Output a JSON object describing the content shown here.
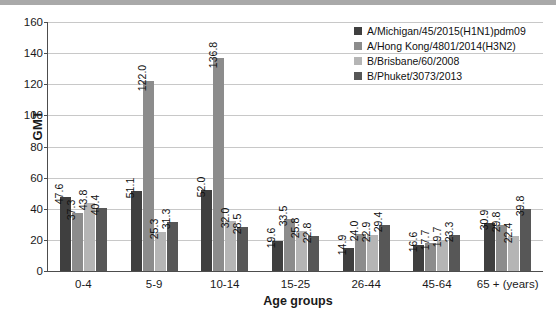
{
  "chart_data": {
    "type": "bar",
    "title": "",
    "xlabel": "Age groups",
    "ylabel": "GMT",
    "ylim": [
      0,
      160
    ],
    "yticks": [
      0,
      20,
      40,
      60,
      80,
      100,
      120,
      140,
      160
    ],
    "grid": true,
    "legend_position": "top-right",
    "categories": [
      "0-4",
      "5-9",
      "10-14",
      "15-25",
      "26-44",
      "45-64",
      "65 + (years)"
    ],
    "series": [
      {
        "name": "A/Michigan/45/2015(H1N1)pdm09",
        "color": "#3f3f3f",
        "values": [
          47.6,
          51.1,
          52.0,
          19.6,
          14.9,
          16.6,
          30.9
        ],
        "labels": [
          "47.6",
          "51.1",
          "52.0",
          "19.6",
          "14.9",
          "16.6",
          "30.9"
        ]
      },
      {
        "name": "A/Hong Kong/4801/2014(H3N2)",
        "color": "#8c8c8c",
        "values": [
          37.3,
          122.0,
          136.8,
          33.5,
          24.0,
          17.7,
          29.8
        ],
        "labels": [
          "37.3",
          "122.0",
          "136.8",
          "33.5",
          "24.0",
          "17.7",
          "29.8"
        ]
      },
      {
        "name": "B/Brisbane/60/2008",
        "color": "#b5b5b5",
        "values": [
          43.8,
          25.3,
          32.0,
          25.8,
          22.9,
          19.7,
          22.4
        ],
        "labels": [
          "43.8",
          "25.3",
          "32.0",
          "25.8",
          "22.9",
          "19.7",
          "22.4"
        ]
      },
      {
        "name": "B/Phuket/3073/2013",
        "color": "#575757",
        "values": [
          40.4,
          31.3,
          28.5,
          22.8,
          29.4,
          23.3,
          39.8
        ],
        "labels": [
          "40.4",
          "31.3",
          "28.5",
          "22.8",
          "29.4",
          "23.3",
          "39.8"
        ]
      }
    ]
  }
}
